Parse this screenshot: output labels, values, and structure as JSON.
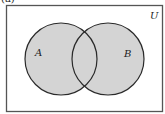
{
  "caption": "(a)",
  "diagram": {
    "type": "venn",
    "universe_label": "U",
    "sets": [
      {
        "label": "A",
        "cx": 61,
        "cy": 59,
        "r": 36
      },
      {
        "label": "B",
        "cx": 108,
        "cy": 59,
        "r": 36
      }
    ],
    "shading": "A ∪ B",
    "colors": {
      "fill": "#d4d4d4",
      "stroke": "#2a2a2a",
      "frame": "#555555",
      "background": "#ffffff"
    }
  }
}
